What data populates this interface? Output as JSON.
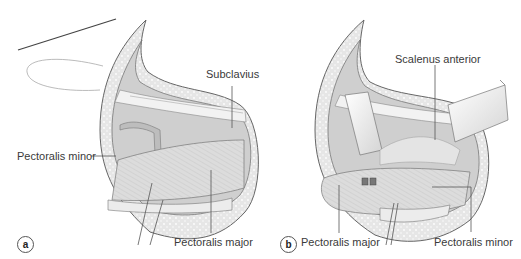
{
  "figure": {
    "panels": [
      {
        "tag": "a",
        "labels": {
          "subclavius": "Subclavius",
          "pectoralis_minor": "Pectoralis minor",
          "pectoralis_major": "Pectoralis major"
        }
      },
      {
        "tag": "b",
        "labels": {
          "scalenus_anterior": "Scalenus anterior",
          "pectoralis_major": "Pectoralis major",
          "pectoralis_minor": "Pectoralis minor"
        }
      }
    ],
    "colors": {
      "skin_outline": "#555555",
      "fat_layer": "#e4e4e4",
      "muscle": "#d9d9d9",
      "cavity": "#c8c8c8",
      "retractor": "#efefef",
      "leader_line": "#555555"
    }
  }
}
